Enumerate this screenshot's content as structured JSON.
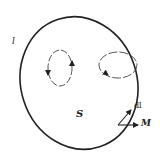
{
  "diagram": {
    "labels": {
      "boundary_curve": "l",
      "surface": "S",
      "line_element": "dl",
      "magnetization": "M"
    },
    "colors": {
      "stroke": "#222222",
      "background": "#ffffff"
    },
    "elements": [
      {
        "id": "surface-boundary",
        "shape": "ellipse",
        "style": "solid",
        "label": "l"
      },
      {
        "id": "inner-current-loop",
        "shape": "ellipse",
        "style": "dashed",
        "arrows": "circulating"
      },
      {
        "id": "boundary-current-loop",
        "shape": "ellipse",
        "style": "solid/dashed",
        "threads_boundary": true
      },
      {
        "id": "dl-vector",
        "shape": "arrow",
        "label": "dl"
      },
      {
        "id": "M-vector",
        "shape": "arrow",
        "label": "M"
      }
    ]
  }
}
